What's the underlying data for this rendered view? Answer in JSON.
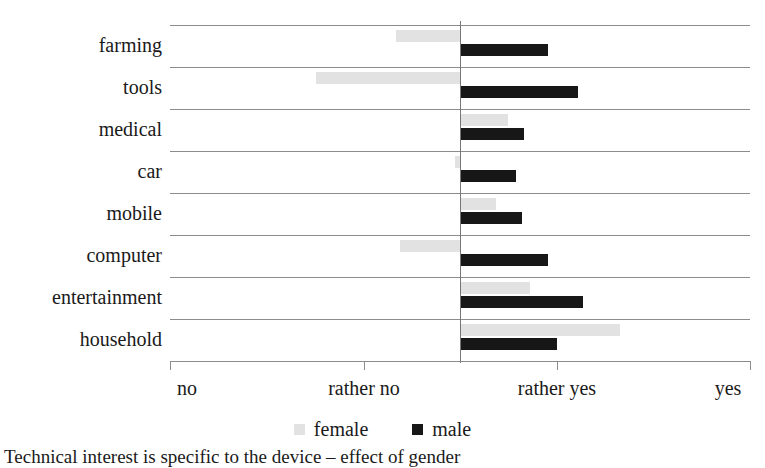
{
  "chart_data": {
    "type": "bar",
    "orientation": "horizontal",
    "title": "",
    "subtitle": "",
    "xlabel": "",
    "ylabel": "",
    "categories": [
      "farming",
      "tools",
      "medical",
      "car",
      "mobile",
      "computer",
      "entertainment",
      "household"
    ],
    "x_tick_labels": [
      "no",
      "rather no",
      "rather yes",
      "yes"
    ],
    "x_tick_values": [
      1,
      2,
      3,
      4
    ],
    "xlim": [
      1,
      4
    ],
    "zero_reference_value": 2.5,
    "grid": true,
    "legend_position": "bottom",
    "series": [
      {
        "name": "female",
        "color": "#e2e2e2",
        "values": [
          2.17,
          1.76,
          2.75,
          2.47,
          2.69,
          2.19,
          2.86,
          3.33
        ]
      },
      {
        "name": "male",
        "color": "#171717",
        "values": [
          2.96,
          3.11,
          2.83,
          2.79,
          2.82,
          2.96,
          3.14,
          3.0
        ]
      }
    ],
    "bar_extents_px": {
      "note": "offsets from zero line at x=460, negative = left of neutral",
      "female": [
        -64,
        -144,
        48,
        -5,
        36,
        -60,
        70,
        160
      ],
      "male": [
        88,
        118,
        64,
        56,
        62,
        88,
        123,
        97
      ]
    }
  },
  "legend": {
    "items": [
      {
        "label": "female",
        "swatch_name": "legend-swatch-female"
      },
      {
        "label": "male",
        "swatch_name": "legend-swatch-male"
      }
    ]
  },
  "caption": {
    "text": "Technical interest is specific to the device – effect of gender"
  },
  "colors": {
    "female": "#e2e2e2",
    "male": "#171717",
    "gridline": "#8c8c8c",
    "axis": "#8c8c8c",
    "text": "#1a1a1a",
    "background": "#ffffff"
  }
}
